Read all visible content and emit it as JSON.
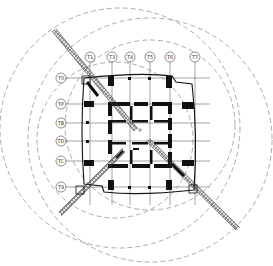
{
  "diagram": {
    "type": "tower-crane-layout-floor-plan",
    "top_caption": "",
    "axis_labels_top": [
      "T1",
      "T3",
      "T4",
      "T5",
      "T6",
      "T7"
    ],
    "axis_labels_left": [
      "T0",
      "TP",
      "TB",
      "TD",
      "TC",
      "T9"
    ],
    "cranes": [
      {
        "name": "crane-northwest",
        "mast": [
          86,
          80
        ]
      },
      {
        "name": "crane-southeast",
        "mast": [
          193,
          189
        ]
      },
      {
        "name": "crane-southwest",
        "mast": [
          80,
          190
        ]
      }
    ],
    "colors": {
      "line": "#222222",
      "dashed": "#777777",
      "column": "#111111",
      "background": "#ffffff"
    }
  }
}
